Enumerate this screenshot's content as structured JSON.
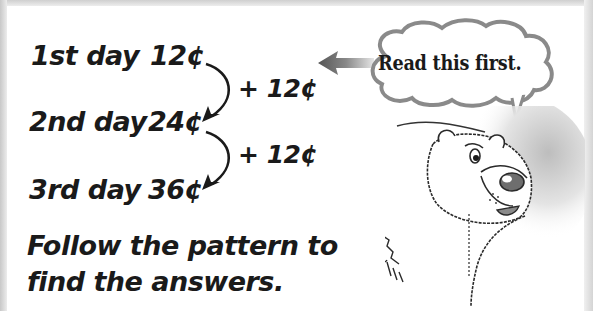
{
  "pattern": {
    "rows": [
      {
        "day": "1st day",
        "amount": "12¢"
      },
      {
        "day": "2nd day",
        "amount": "24¢"
      },
      {
        "day": "3rd day",
        "amount": "36¢"
      }
    ],
    "increments": [
      "+ 12¢",
      "+ 12¢"
    ]
  },
  "instruction": {
    "line1": "Follow the pattern to",
    "line2": "find the answers."
  },
  "speech_bubble": {
    "text": "Read this first."
  },
  "icons": {
    "pointer": "left-arrow-icon",
    "character": "polar-bear-illustration",
    "step_arrow": "curved-arrow-icon"
  },
  "colors": {
    "text": "#1a1a1a",
    "bubble_outline": "#8a8a8a",
    "frame": "#d0d0d0"
  }
}
